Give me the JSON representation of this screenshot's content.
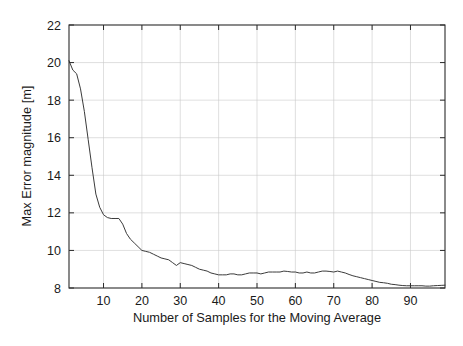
{
  "chart_data": {
    "type": "line",
    "title": "",
    "xlabel": "Number of Samples for the Moving Average",
    "ylabel": "Max Error magnitude [m]",
    "xlim": [
      1,
      99
    ],
    "ylim": [
      8,
      22
    ],
    "xticks": [
      10,
      20,
      30,
      40,
      50,
      60,
      70,
      80,
      90
    ],
    "yticks": [
      8,
      10,
      12,
      14,
      16,
      18,
      20,
      22
    ],
    "xtick_labels": [
      "10",
      "20",
      "30",
      "40",
      "50",
      "60",
      "70",
      "80",
      "90"
    ],
    "ytick_labels": [
      "8",
      "10",
      "12",
      "14",
      "16",
      "18",
      "20",
      "22"
    ],
    "grid": true,
    "grid_color": "#c9c9c9",
    "legend": null,
    "series": [
      {
        "name": "Max error vs moving-average window",
        "color": "#3b3b3b",
        "x": [
          1,
          2,
          3,
          4,
          5,
          6,
          7,
          8,
          9,
          10,
          11,
          12,
          13,
          14,
          15,
          16,
          17,
          18,
          19,
          20,
          21,
          22,
          23,
          24,
          25,
          26,
          27,
          28,
          29,
          30,
          31,
          32,
          33,
          34,
          35,
          36,
          37,
          38,
          39,
          40,
          41,
          42,
          43,
          44,
          45,
          46,
          47,
          48,
          49,
          50,
          51,
          52,
          53,
          54,
          55,
          56,
          57,
          58,
          59,
          60,
          61,
          62,
          63,
          64,
          65,
          66,
          67,
          68,
          69,
          70,
          71,
          72,
          73,
          74,
          75,
          76,
          77,
          78,
          79,
          80,
          81,
          82,
          83,
          84,
          85,
          86,
          87,
          88,
          89,
          90,
          91,
          92,
          93,
          94,
          95,
          96,
          97,
          98,
          99
        ],
        "y": [
          20.1,
          19.6,
          19.4,
          18.6,
          17.4,
          15.9,
          14.4,
          13.0,
          12.3,
          11.9,
          11.75,
          11.7,
          11.7,
          11.7,
          11.4,
          10.9,
          10.6,
          10.4,
          10.2,
          10.0,
          9.95,
          9.9,
          9.8,
          9.7,
          9.6,
          9.55,
          9.5,
          9.35,
          9.2,
          9.35,
          9.3,
          9.25,
          9.2,
          9.1,
          9.0,
          8.95,
          8.9,
          8.8,
          8.75,
          8.7,
          8.7,
          8.7,
          8.75,
          8.75,
          8.7,
          8.7,
          8.75,
          8.8,
          8.8,
          8.8,
          8.75,
          8.8,
          8.85,
          8.85,
          8.85,
          8.85,
          8.9,
          8.88,
          8.85,
          8.85,
          8.8,
          8.8,
          8.85,
          8.8,
          8.8,
          8.85,
          8.9,
          8.9,
          8.88,
          8.85,
          8.9,
          8.85,
          8.8,
          8.72,
          8.65,
          8.6,
          8.55,
          8.5,
          8.45,
          8.4,
          8.35,
          8.3,
          8.28,
          8.25,
          8.2,
          8.18,
          8.15,
          8.13,
          8.12,
          8.12,
          8.12,
          8.12,
          8.12,
          8.1,
          8.1,
          8.12,
          8.13,
          8.14,
          8.15
        ]
      }
    ]
  },
  "plot_geometry": {
    "left": 69,
    "right": 445,
    "top": 25,
    "bottom": 288
  }
}
